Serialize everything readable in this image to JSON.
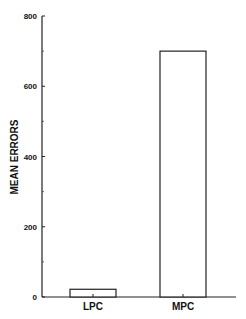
{
  "chart_data": {
    "type": "bar",
    "title": "",
    "xlabel": "",
    "ylabel": "MEAN ERRORS",
    "categories": [
      "LPC",
      "MPC"
    ],
    "values": [
      22,
      700
    ],
    "ylim": [
      0,
      800
    ],
    "yticks": [
      "0",
      "200",
      "400",
      "600",
      "800"
    ],
    "minor_ticks": [
      100,
      300,
      500,
      700
    ],
    "grid": false,
    "legend": null,
    "bar_fill": "#ffffff",
    "bar_stroke": "#222222"
  }
}
